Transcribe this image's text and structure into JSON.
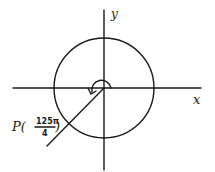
{
  "diagram": {
    "type": "unit-circle-angle",
    "axes": {
      "x_label": "x",
      "y_label": "y"
    },
    "point": {
      "name": "P",
      "numerator": "125π",
      "denominator": "4",
      "label_prefix": "P(",
      "label_suffix": ")"
    },
    "angle_ray_direction": "third quadrant (225°)",
    "colors": {
      "ink": "#1a1a1a",
      "background": "#ffffff"
    }
  }
}
